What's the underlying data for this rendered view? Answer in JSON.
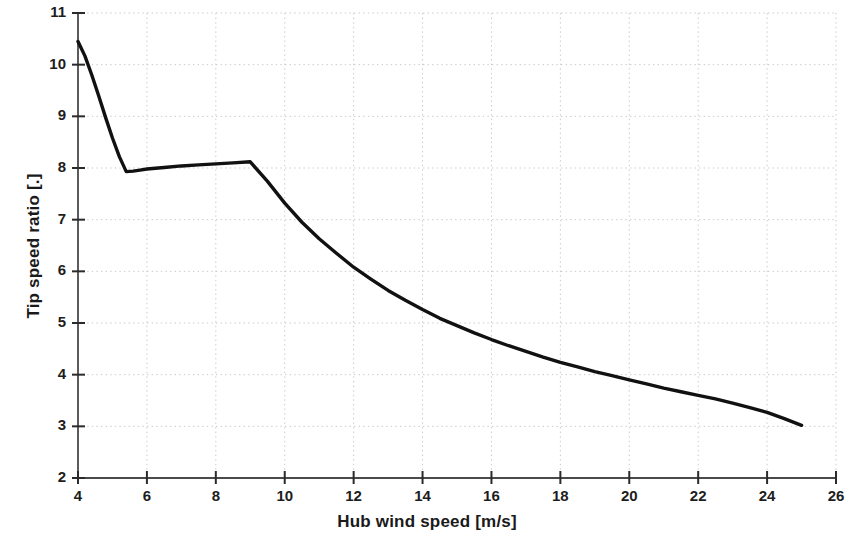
{
  "chart_data": {
    "type": "line",
    "title": "",
    "xlabel": "Hub wind speed [m/s]",
    "ylabel": "Tip speed ratio [.]",
    "xlim": [
      4,
      26
    ],
    "ylim": [
      2,
      11
    ],
    "xticks": [
      4,
      6,
      8,
      10,
      12,
      14,
      16,
      18,
      20,
      22,
      24,
      26
    ],
    "yticks": [
      2,
      3,
      4,
      5,
      6,
      7,
      8,
      9,
      10,
      11
    ],
    "grid": "dotted-both-axes",
    "legend": null,
    "line_color": "#111111",
    "line_width": 3.4,
    "series": [
      {
        "name": "Tip speed ratio",
        "x": [
          4.0,
          4.2,
          4.4,
          4.6,
          4.8,
          5.0,
          5.2,
          5.4,
          5.6,
          5.8,
          6.0,
          6.5,
          7.0,
          7.5,
          8.0,
          8.5,
          9.0,
          9.5,
          10.0,
          10.5,
          11.0,
          11.5,
          12.0,
          12.5,
          13.0,
          13.5,
          14.0,
          14.5,
          15.0,
          15.5,
          16.0,
          16.5,
          17.0,
          17.5,
          18.0,
          18.5,
          19.0,
          19.5,
          20.0,
          20.5,
          21.0,
          21.5,
          22.0,
          22.5,
          23.0,
          23.5,
          24.0,
          24.5,
          25.0
        ],
        "y": [
          10.45,
          10.17,
          9.8,
          9.4,
          8.98,
          8.58,
          8.22,
          7.93,
          7.94,
          7.96,
          7.98,
          8.01,
          8.04,
          8.06,
          8.08,
          8.1,
          8.12,
          7.74,
          7.32,
          6.95,
          6.63,
          6.35,
          6.08,
          5.85,
          5.63,
          5.44,
          5.26,
          5.09,
          4.95,
          4.81,
          4.68,
          4.56,
          4.45,
          4.34,
          4.24,
          4.15,
          4.06,
          3.98,
          3.9,
          3.82,
          3.74,
          3.67,
          3.6,
          3.53,
          3.45,
          3.36,
          3.27,
          3.15,
          3.02
        ]
      }
    ]
  },
  "axes": {
    "x_tick_labels": [
      "4",
      "6",
      "8",
      "10",
      "12",
      "14",
      "16",
      "18",
      "20",
      "22",
      "24",
      "26"
    ],
    "y_tick_labels": [
      "2",
      "3",
      "4",
      "5",
      "6",
      "7",
      "8",
      "9",
      "10",
      "11"
    ]
  }
}
